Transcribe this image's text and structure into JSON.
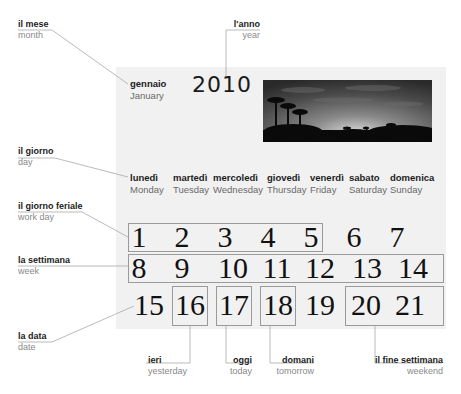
{
  "annotations": {
    "month": {
      "it": "il mese",
      "en": "month"
    },
    "year": {
      "it": "l'anno",
      "en": "year"
    },
    "day": {
      "it": "il giorno",
      "en": "day"
    },
    "workday": {
      "it": "il giorno feriale",
      "en": "work day"
    },
    "week": {
      "it": "la settimana",
      "en": "week"
    },
    "date": {
      "it": "la data",
      "en": "date"
    },
    "yesterday": {
      "it": "ieri",
      "en": "yesterday"
    },
    "today": {
      "it": "oggi",
      "en": "today"
    },
    "tomorrow": {
      "it": "domani",
      "en": "tomorrow"
    },
    "weekend": {
      "it": "il fine settimana",
      "en": "weekend"
    }
  },
  "calendar": {
    "month_it": "gennaio",
    "month_en": "January",
    "year": "2010",
    "photo": "palm-trees-sunset-photo",
    "weekdays": [
      {
        "it": "lunedì",
        "en": "Monday"
      },
      {
        "it": "martedì",
        "en": "Tuesday"
      },
      {
        "it": "mercoledì",
        "en": "Wednesday"
      },
      {
        "it": "giovedì",
        "en": "Thursday"
      },
      {
        "it": "venerdì",
        "en": "Friday"
      },
      {
        "it": "sabato",
        "en": "Saturday"
      },
      {
        "it": "domenica",
        "en": "Sunday"
      }
    ],
    "weeks": [
      [
        "1",
        "2",
        "3",
        "4",
        "5",
        "6",
        "7"
      ],
      [
        "8",
        "9",
        "10",
        "11",
        "12",
        "13",
        "14"
      ],
      [
        "15",
        "16",
        "17",
        "18",
        "19",
        "20",
        "21"
      ]
    ]
  },
  "colors": {
    "panel": "#f1f1f1",
    "leader_line": "#a0a0a0",
    "box_border": "#9a9a9a"
  }
}
